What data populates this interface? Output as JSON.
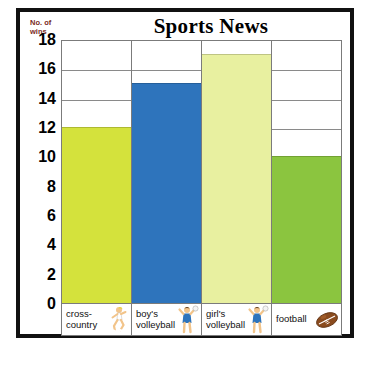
{
  "chart_data": {
    "type": "bar",
    "title": "Sports News",
    "xlabel": "",
    "ylabel": "No. of\nwins",
    "categories": [
      "cross-\ncountry",
      "boy's\nvolleyball",
      "girl's\nvolleyball",
      "football"
    ],
    "values": [
      12,
      15,
      17,
      10
    ],
    "ylim": [
      0,
      18
    ],
    "ytick_step": 2,
    "yticks": [
      18,
      16,
      14,
      12,
      10,
      8,
      6,
      4,
      2,
      0
    ],
    "grid": true,
    "legend": "none",
    "bar_colors": [
      "#d4e23c",
      "#2e74bc",
      "#e8f0a0",
      "#8bc53f"
    ],
    "category_icons": [
      "runner-icon",
      "volleyball-player-icon",
      "volleyball-player-icon",
      "football-icon"
    ]
  },
  "style": {
    "frame_color": "#111111",
    "grid_color": "#8a8a8a",
    "axis_color": "#7b7b7b",
    "ylabel_color": "#7a2b1d",
    "title_color": "#000000"
  }
}
